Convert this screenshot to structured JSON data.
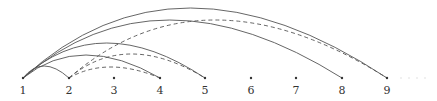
{
  "diagram": {
    "type": "arc-diagram",
    "baseline_y": 78,
    "label_y": 94,
    "nodes": [
      {
        "id": "1",
        "label": "1",
        "x": 23
      },
      {
        "id": "2",
        "label": "2",
        "x": 69
      },
      {
        "id": "3",
        "label": "3",
        "x": 114
      },
      {
        "id": "4",
        "label": "4",
        "x": 160
      },
      {
        "id": "5",
        "label": "5",
        "x": 205
      },
      {
        "id": "6",
        "label": "6",
        "x": 251
      },
      {
        "id": "7",
        "label": "7",
        "x": 296
      },
      {
        "id": "8",
        "label": "8",
        "x": 342
      },
      {
        "id": "9",
        "label": "9",
        "x": 387
      }
    ],
    "edges": [
      {
        "from": "1",
        "to": "2",
        "style": "solid",
        "peak_y": 66
      },
      {
        "from": "1",
        "to": "4",
        "style": "solid",
        "peak_y": 55
      },
      {
        "from": "1",
        "to": "5",
        "style": "solid",
        "peak_y": 43
      },
      {
        "from": "1",
        "to": "8",
        "style": "solid",
        "peak_y": 20
      },
      {
        "from": "1",
        "to": "9",
        "style": "solid",
        "peak_y": 8
      },
      {
        "from": "2",
        "to": "4",
        "style": "dashed",
        "peak_y": 67
      },
      {
        "from": "2",
        "to": "5",
        "style": "dashed",
        "peak_y": 54
      },
      {
        "from": "2",
        "to": "9",
        "style": "dashed",
        "peak_y": 20
      }
    ],
    "continuation": "…",
    "colors": {
      "edge": "#555555",
      "node": "#333333"
    }
  }
}
